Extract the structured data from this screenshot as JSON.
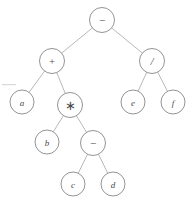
{
  "figure": {
    "type": "binary-expression-tree",
    "background_color": "#ffffff",
    "node_stroke_color": "#777777",
    "edge_stroke_color": "#9a9a9a",
    "label_color": "#4a4a4a",
    "node_radius": 12
  },
  "nodes": [
    {
      "id": "n0",
      "label": "−",
      "kind": "operator",
      "cx": 102,
      "cy": 20,
      "r": 12.5,
      "style": "op-minus"
    },
    {
      "id": "n1",
      "label": "+",
      "kind": "operator",
      "cx": 52,
      "cy": 61,
      "r": 12.5,
      "style": "op"
    },
    {
      "id": "n2",
      "label": "/",
      "kind": "operator",
      "cx": 152,
      "cy": 61,
      "r": 12.5,
      "style": "op-slash"
    },
    {
      "id": "n3",
      "label": "a",
      "kind": "variable",
      "cx": 22,
      "cy": 102,
      "r": 12,
      "style": "var"
    },
    {
      "id": "n4",
      "label": "∗",
      "kind": "operator",
      "cx": 70,
      "cy": 105,
      "r": 12.5,
      "style": "op-star"
    },
    {
      "id": "n5",
      "label": "e",
      "kind": "variable",
      "cx": 133,
      "cy": 102,
      "r": 12,
      "style": "var"
    },
    {
      "id": "n6",
      "label": "f",
      "kind": "variable",
      "cx": 173,
      "cy": 102,
      "r": 12,
      "style": "var"
    },
    {
      "id": "n7",
      "label": "b",
      "kind": "variable",
      "cx": 47,
      "cy": 142,
      "r": 12,
      "style": "var"
    },
    {
      "id": "n8",
      "label": "−",
      "kind": "operator",
      "cx": 93,
      "cy": 143,
      "r": 12.5,
      "style": "op-minus"
    },
    {
      "id": "n9",
      "label": "c",
      "kind": "variable",
      "cx": 73,
      "cy": 184,
      "r": 12,
      "style": "var"
    },
    {
      "id": "n10",
      "label": "d",
      "kind": "variable",
      "cx": 113,
      "cy": 184,
      "r": 12,
      "style": "var"
    }
  ],
  "edges": [
    {
      "from": "n0",
      "to": "n1"
    },
    {
      "from": "n0",
      "to": "n2"
    },
    {
      "from": "n1",
      "to": "n3"
    },
    {
      "from": "n1",
      "to": "n4"
    },
    {
      "from": "n2",
      "to": "n5"
    },
    {
      "from": "n2",
      "to": "n6"
    },
    {
      "from": "n4",
      "to": "n7"
    },
    {
      "from": "n4",
      "to": "n8"
    },
    {
      "from": "n8",
      "to": "n9"
    },
    {
      "from": "n8",
      "to": "n10"
    }
  ]
}
